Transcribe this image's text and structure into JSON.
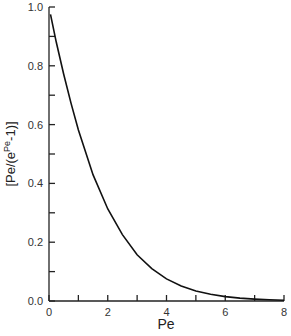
{
  "chart_data": {
    "type": "line",
    "title": "",
    "xlabel": "Pe",
    "ylabel": "[Pe/(e^Pe -1)]",
    "ylabel_parts": {
      "open": "[",
      "base": "Pe/(e",
      "sup": "Pe",
      "tail": "-1)",
      "close": "]"
    },
    "xlim": [
      0,
      8
    ],
    "ylim": [
      0.0,
      1.0
    ],
    "x_ticks": [
      0,
      2,
      4,
      6,
      8
    ],
    "x_tick_labels": [
      "0",
      "2",
      "4",
      "6",
      "8"
    ],
    "x_minor_ticks": [
      1,
      3,
      5,
      7
    ],
    "y_ticks": [
      0.0,
      0.2,
      0.4,
      0.6,
      0.8,
      1.0
    ],
    "y_tick_labels": [
      "0.0",
      "0.2",
      "0.4",
      "0.6",
      "0.8",
      "1.0"
    ],
    "y_minor_ticks": [
      0.1,
      0.3,
      0.5,
      0.7,
      0.9
    ],
    "grid": false,
    "legend": null,
    "series": [
      {
        "name": "Pe/(e^Pe - 1)",
        "x": [
          0.05,
          0.25,
          0.5,
          0.75,
          1.0,
          1.5,
          2.0,
          2.5,
          3.0,
          3.5,
          4.0,
          4.5,
          5.0,
          5.5,
          6.0,
          6.5,
          7.0,
          7.5,
          8.0
        ],
        "y": [
          0.975,
          0.88,
          0.771,
          0.673,
          0.582,
          0.429,
          0.313,
          0.226,
          0.157,
          0.11,
          0.075,
          0.051,
          0.034,
          0.023,
          0.015,
          0.01,
          0.0064,
          0.0042,
          0.0027
        ]
      }
    ]
  }
}
